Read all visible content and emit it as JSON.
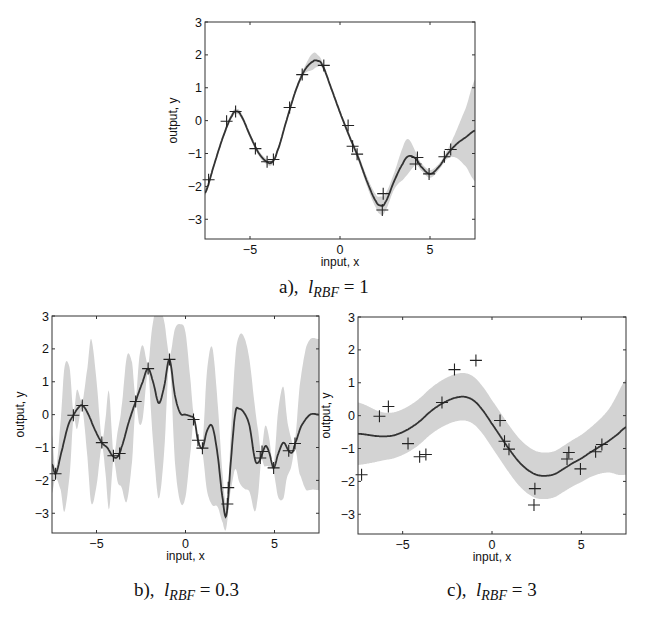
{
  "figure": {
    "captions": {
      "a": {
        "prefix": "a),",
        "symbol": "l",
        "subscript": "RBF",
        "equals": "=",
        "value": "1"
      },
      "b": {
        "prefix": "b),",
        "symbol": "l",
        "subscript": "RBF",
        "equals": "=",
        "value": "0.3"
      },
      "c": {
        "prefix": "c),",
        "symbol": "l",
        "subscript": "RBF",
        "equals": "=",
        "value": "3"
      }
    }
  },
  "colors": {
    "band": "#d3d3d3",
    "line": "#333333",
    "marker": "#222222",
    "axis": "#333333"
  },
  "chart_data": [
    {
      "id": "a",
      "type": "line",
      "title": "a), l_RBF = 1",
      "xlabel": "input, x",
      "ylabel": "output, y",
      "xlim": [
        -7.5,
        7.5
      ],
      "ylim": [
        -3.6,
        3
      ],
      "xticks": [
        -5,
        0,
        5
      ],
      "yticks": [
        -3,
        -2,
        -1,
        0,
        1,
        2,
        3
      ],
      "grid": false,
      "series": [
        {
          "name": "training data",
          "type": "scatter",
          "marker": "+",
          "x": [
            -7.3,
            -6.3,
            -5.8,
            -4.7,
            -4.05,
            -3.7,
            -2.8,
            -2.1,
            -0.9,
            0.45,
            0.7,
            0.95,
            2.4,
            2.35,
            4.2,
            4.3,
            4.95,
            5.8,
            6.15
          ],
          "y": [
            -1.8,
            -0.02,
            0.28,
            -0.85,
            -1.25,
            -1.18,
            0.4,
            1.4,
            1.68,
            -0.15,
            -0.78,
            -1.02,
            -2.22,
            -2.72,
            -1.32,
            -1.12,
            -1.62,
            -1.1,
            -0.88
          ]
        },
        {
          "name": "posterior mean",
          "type": "line",
          "x": [
            -7.5,
            -7.0,
            -6.5,
            -6.0,
            -5.75,
            -5.5,
            -5.0,
            -4.5,
            -4.0,
            -3.75,
            -3.5,
            -3.0,
            -2.5,
            -2.0,
            -1.5,
            -1.25,
            -1.0,
            -0.5,
            0.0,
            0.5,
            1.0,
            1.5,
            2.0,
            2.25,
            2.5,
            3.0,
            3.5,
            3.8,
            4.2,
            4.5,
            5.0,
            5.5,
            6.0,
            6.5,
            7.0,
            7.5
          ],
          "y": [
            -2.2,
            -1.35,
            -0.5,
            0.15,
            0.28,
            0.15,
            -0.45,
            -1.0,
            -1.27,
            -1.25,
            -0.95,
            -0.05,
            0.85,
            1.5,
            1.8,
            1.82,
            1.7,
            1.0,
            0.25,
            -0.45,
            -1.1,
            -1.85,
            -2.45,
            -2.58,
            -2.5,
            -1.85,
            -1.3,
            -1.08,
            -1.15,
            -1.4,
            -1.62,
            -1.4,
            -1.0,
            -0.7,
            -0.5,
            -0.3
          ]
        },
        {
          "name": "±2σ band",
          "type": "area",
          "x": [
            -7.5,
            -6.0,
            -5.0,
            -4.0,
            -3.0,
            -2.0,
            -1.5,
            -1.0,
            0.0,
            1.0,
            2.0,
            2.3,
            3.0,
            3.7,
            4.3,
            5.0,
            5.8,
            6.3,
            7.0,
            7.5
          ],
          "half_width": [
            0.08,
            0.08,
            0.08,
            0.08,
            0.08,
            0.1,
            0.25,
            0.1,
            0.08,
            0.1,
            0.2,
            0.28,
            0.25,
            0.55,
            0.15,
            0.12,
            0.1,
            0.3,
            0.9,
            1.55
          ]
        }
      ]
    },
    {
      "id": "b",
      "type": "line",
      "title": "b), l_RBF = 0.3",
      "xlabel": "input, x",
      "ylabel": "output, y",
      "xlim": [
        -7.5,
        7.5
      ],
      "ylim": [
        -3.6,
        3
      ],
      "xticks": [
        -5,
        0,
        5
      ],
      "yticks": [
        -3,
        -2,
        -1,
        0,
        1,
        2,
        3
      ],
      "grid": false,
      "series": [
        {
          "name": "training data",
          "type": "scatter",
          "marker": "+",
          "x": [
            -7.3,
            -6.3,
            -5.8,
            -4.7,
            -4.05,
            -3.7,
            -2.8,
            -2.1,
            -0.9,
            0.45,
            0.7,
            0.95,
            2.4,
            2.35,
            4.2,
            4.3,
            4.95,
            5.8,
            6.15
          ],
          "y": [
            -1.8,
            -0.02,
            0.28,
            -0.85,
            -1.25,
            -1.18,
            0.4,
            1.4,
            1.68,
            -0.15,
            -0.78,
            -1.02,
            -2.22,
            -2.72,
            -1.32,
            -1.12,
            -1.62,
            -1.1,
            -0.88
          ]
        },
        {
          "name": "posterior mean",
          "type": "line",
          "x": [
            -7.5,
            -7.3,
            -7.0,
            -6.6,
            -6.3,
            -6.0,
            -5.8,
            -5.5,
            -5.1,
            -4.7,
            -4.4,
            -4.1,
            -3.85,
            -3.6,
            -3.2,
            -2.8,
            -2.4,
            -2.1,
            -1.8,
            -1.5,
            -1.2,
            -0.9,
            -0.6,
            -0.3,
            0.0,
            0.3,
            0.5,
            0.7,
            0.95,
            1.2,
            1.5,
            1.8,
            2.1,
            2.3,
            2.55,
            2.8,
            3.0,
            3.3,
            3.6,
            3.9,
            4.1,
            4.3,
            4.5,
            4.7,
            4.95,
            5.2,
            5.5,
            5.8,
            6.0,
            6.15,
            6.5,
            7.0,
            7.5
          ],
          "y": [
            -1.5,
            -1.8,
            -1.2,
            -0.35,
            -0.02,
            0.22,
            0.28,
            0.05,
            -0.45,
            -0.85,
            -1.0,
            -1.25,
            -1.3,
            -1.0,
            -0.25,
            0.4,
            1.0,
            1.4,
            0.95,
            0.35,
            0.85,
            1.68,
            0.6,
            0.05,
            0.0,
            -0.05,
            -0.15,
            -0.78,
            -1.02,
            -0.5,
            -0.35,
            -1.2,
            -2.6,
            -3.05,
            -1.4,
            0.05,
            0.18,
            0.05,
            -0.35,
            -1.35,
            -1.45,
            -1.2,
            -0.95,
            -1.15,
            -1.62,
            -1.2,
            -0.85,
            -1.1,
            -1.15,
            -0.88,
            -0.35,
            0.0,
            0.0
          ]
        },
        {
          "name": "±2σ band",
          "type": "area",
          "x": [
            -7.5,
            -7.3,
            -7.0,
            -6.8,
            -6.5,
            -6.3,
            -6.1,
            -5.8,
            -5.5,
            -5.3,
            -5.0,
            -4.7,
            -4.5,
            -4.3,
            -4.05,
            -3.8,
            -3.6,
            -3.3,
            -3.0,
            -2.8,
            -2.6,
            -2.4,
            -2.1,
            -1.9,
            -1.7,
            -1.5,
            -1.2,
            -0.9,
            -0.6,
            -0.3,
            0.0,
            0.3,
            0.45,
            0.7,
            0.95,
            1.2,
            1.5,
            1.8,
            2.1,
            2.38,
            2.7,
            3.0,
            3.3,
            3.6,
            3.9,
            4.1,
            4.25,
            4.45,
            4.65,
            4.95,
            5.2,
            5.5,
            5.7,
            5.9,
            6.15,
            6.4,
            6.8,
            7.5
          ],
          "half_width": [
            0.9,
            0.12,
            1.1,
            2.2,
            1.6,
            0.12,
            0.6,
            0.12,
            1.4,
            2.5,
            1.6,
            0.12,
            0.8,
            1.8,
            0.12,
            0.8,
            1.2,
            2.2,
            1.5,
            0.12,
            1.0,
            1.1,
            0.12,
            1.4,
            2.4,
            2.9,
            2.0,
            0.12,
            2.0,
            2.7,
            2.5,
            1.0,
            0.12,
            0.12,
            0.12,
            1.8,
            2.4,
            1.6,
            0.7,
            0.4,
            1.4,
            2.2,
            2.3,
            2.0,
            1.6,
            0.9,
            0.12,
            0.6,
            0.5,
            0.12,
            1.3,
            1.7,
            0.9,
            0.5,
            0.12,
            1.3,
            2.2,
            2.3
          ]
        }
      ]
    },
    {
      "id": "c",
      "type": "line",
      "title": "c), l_RBF = 3",
      "xlabel": "input, x",
      "ylabel": "output, y",
      "xlim": [
        -7.5,
        7.5
      ],
      "ylim": [
        -3.6,
        3
      ],
      "xticks": [
        -5,
        0,
        5
      ],
      "yticks": [
        -3,
        -2,
        -1,
        0,
        1,
        2,
        3
      ],
      "grid": false,
      "series": [
        {
          "name": "training data",
          "type": "scatter",
          "marker": "+",
          "x": [
            -7.3,
            -6.3,
            -5.8,
            -4.7,
            -4.05,
            -3.7,
            -2.8,
            -2.1,
            -0.9,
            0.45,
            0.7,
            0.95,
            2.4,
            2.35,
            4.2,
            4.3,
            4.95,
            5.8,
            6.15
          ],
          "y": [
            -1.8,
            -0.02,
            0.28,
            -0.85,
            -1.25,
            -1.18,
            0.4,
            1.4,
            1.68,
            -0.15,
            -0.78,
            -1.02,
            -2.22,
            -2.72,
            -1.32,
            -1.12,
            -1.62,
            -1.1,
            -0.88
          ]
        },
        {
          "name": "posterior mean",
          "type": "line",
          "x": [
            -7.5,
            -7.0,
            -6.5,
            -6.0,
            -5.5,
            -5.0,
            -4.5,
            -4.0,
            -3.5,
            -3.0,
            -2.5,
            -2.0,
            -1.5,
            -1.0,
            -0.5,
            0.0,
            0.5,
            1.0,
            1.5,
            2.0,
            2.5,
            3.0,
            3.5,
            4.0,
            4.5,
            5.0,
            5.5,
            6.0,
            6.5,
            7.0,
            7.5
          ],
          "y": [
            -0.55,
            -0.58,
            -0.62,
            -0.63,
            -0.6,
            -0.5,
            -0.35,
            -0.15,
            0.1,
            0.3,
            0.45,
            0.55,
            0.57,
            0.45,
            0.15,
            -0.25,
            -0.65,
            -1.05,
            -1.4,
            -1.65,
            -1.8,
            -1.83,
            -1.78,
            -1.62,
            -1.45,
            -1.3,
            -1.12,
            -0.95,
            -0.78,
            -0.58,
            -0.35
          ]
        },
        {
          "name": "±2σ band",
          "type": "area",
          "x": [
            -7.5,
            -6.0,
            -4.0,
            -2.0,
            0.0,
            2.0,
            4.0,
            5.5,
            6.5,
            7.5
          ],
          "half_width": [
            0.95,
            0.72,
            0.7,
            0.72,
            0.72,
            0.72,
            0.7,
            0.75,
            0.95,
            1.45
          ]
        }
      ]
    }
  ]
}
